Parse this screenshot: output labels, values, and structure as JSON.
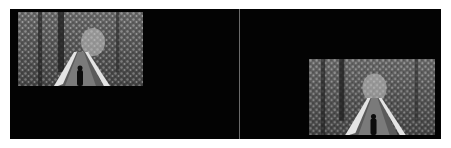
{
  "layout": {
    "panels": [
      {
        "id": "left",
        "image": {
          "alt": "Black and white photo of a person walking on a snowy wooden bridge through a forest",
          "position": "top-left"
        }
      },
      {
        "id": "right",
        "image": {
          "alt": "Black and white photo of a person walking on a snowy wooden bridge through a forest",
          "position": "bottom-right"
        }
      }
    ]
  },
  "colors": {
    "background": "#030303",
    "divider": "#6a6a6a",
    "page": "#ffffff"
  }
}
